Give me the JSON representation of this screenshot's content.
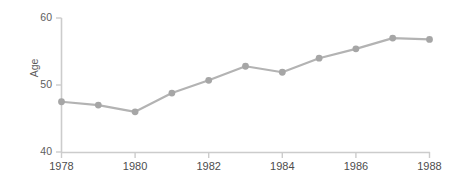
{
  "chart_data": {
    "type": "line",
    "title": "",
    "subtitle": "",
    "xlabel": "",
    "ylabel": "Age",
    "x": [
      1978,
      1979,
      1980,
      1981,
      1982,
      1983,
      1984,
      1985,
      1986,
      1987,
      1988
    ],
    "values": [
      47.5,
      47.0,
      46.0,
      48.8,
      50.7,
      52.8,
      51.9,
      54.0,
      55.4,
      57.0,
      56.8
    ],
    "series": [
      {
        "name": "Age",
        "values": [
          47.5,
          47.0,
          46.0,
          48.8,
          50.7,
          52.8,
          51.9,
          54.0,
          55.4,
          57.0,
          56.8
        ]
      }
    ],
    "xlim": [
      1978,
      1988
    ],
    "ylim": [
      40,
      60
    ],
    "xticks": [
      1978,
      1980,
      1982,
      1984,
      1986,
      1988
    ],
    "xtick_labels": [
      "1978",
      "1980",
      "1982",
      "1984",
      "1986",
      "1988"
    ],
    "yticks": [
      40,
      50,
      60
    ],
    "ytick_labels": [
      "40",
      "50",
      "60"
    ],
    "grid": false,
    "legend": "none",
    "line_color": "#b3b3b3",
    "marker_color": "#a6a6a6",
    "axis_color": "#c8c8c8",
    "text_color": "#595959",
    "background_color": "#ffffff",
    "marker_shape": "circle"
  },
  "axis": {
    "y_title": "Age",
    "y_ticks": [
      "60",
      "50",
      "40"
    ],
    "x_ticks": [
      "1978",
      "1980",
      "1982",
      "1984",
      "1986",
      "1988"
    ]
  }
}
